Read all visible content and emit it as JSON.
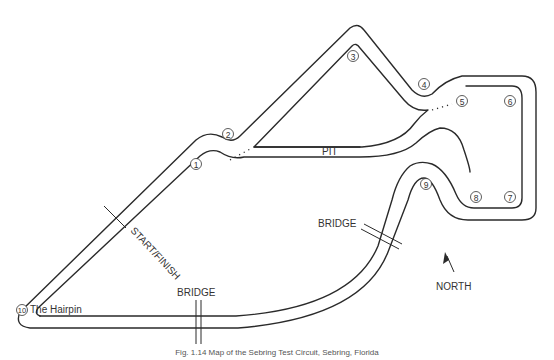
{
  "map": {
    "labels": {
      "pit": "PIT",
      "start_finish": "START/FINISH",
      "bridge_1": "BRIDGE",
      "bridge_2": "BRIDGE",
      "hairpin": "The Hairpin",
      "north": "NORTH"
    },
    "turns": [
      {
        "number": "1",
        "x": 196,
        "y": 164
      },
      {
        "number": "2",
        "x": 228,
        "y": 134
      },
      {
        "number": "3",
        "x": 353,
        "y": 56
      },
      {
        "number": "4",
        "x": 424,
        "y": 84
      },
      {
        "number": "5",
        "x": 462,
        "y": 101
      },
      {
        "number": "6",
        "x": 510,
        "y": 101
      },
      {
        "number": "7",
        "x": 510,
        "y": 197
      },
      {
        "number": "8",
        "x": 476,
        "y": 197
      },
      {
        "number": "9",
        "x": 426,
        "y": 184
      },
      {
        "number": "10",
        "x": 22,
        "y": 310
      }
    ],
    "colors": {
      "line": "#2a2a2a",
      "text": "#333333",
      "background": "#ffffff"
    }
  },
  "caption": "Fig. 1.14  Map of the Sebring Test Circuit, Sebring, Florida"
}
